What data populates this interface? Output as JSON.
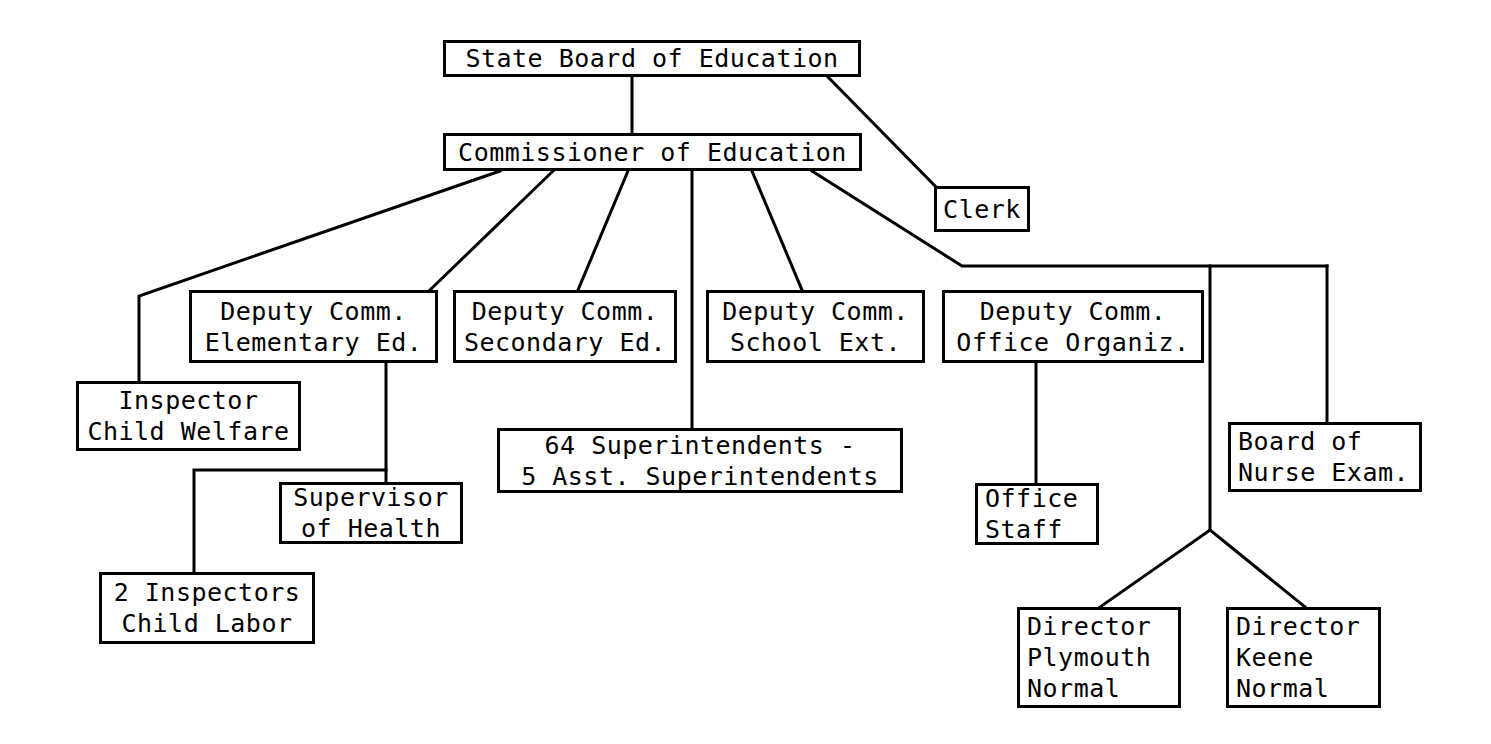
{
  "diagram": {
    "style": {
      "line_color": "#000000",
      "box_fill": "#ffffff",
      "background": "#ffffff"
    },
    "nodes": [
      {
        "id": "state-board",
        "name": "state-board-of-education",
        "lines": [
          "State Board of Education"
        ],
        "x": 443,
        "y": 40,
        "w": 418,
        "h": 37,
        "align": "center"
      },
      {
        "id": "commissioner",
        "name": "commissioner-of-education",
        "lines": [
          "Commissioner of Education"
        ],
        "x": 443,
        "y": 133,
        "w": 419,
        "h": 38,
        "align": "center"
      },
      {
        "id": "clerk",
        "name": "clerk",
        "lines": [
          "Clerk"
        ],
        "x": 934,
        "y": 186,
        "w": 96,
        "h": 46,
        "align": "center"
      },
      {
        "id": "deputy-elementary",
        "name": "deputy-comm-elementary-ed",
        "lines": [
          "Deputy Comm.",
          "Elementary Ed."
        ],
        "x": 189,
        "y": 290,
        "w": 249,
        "h": 73,
        "align": "center"
      },
      {
        "id": "deputy-secondary",
        "name": "deputy-comm-secondary-ed",
        "lines": [
          "Deputy Comm.",
          "Secondary Ed."
        ],
        "x": 453,
        "y": 290,
        "w": 224,
        "h": 73,
        "align": "center"
      },
      {
        "id": "deputy-school-ext",
        "name": "deputy-comm-school-ext",
        "lines": [
          "Deputy Comm.",
          "School Ext."
        ],
        "x": 706,
        "y": 290,
        "w": 219,
        "h": 73,
        "align": "center"
      },
      {
        "id": "deputy-office-organiz",
        "name": "deputy-comm-office-organiz",
        "lines": [
          "Deputy Comm.",
          "Office Organiz."
        ],
        "x": 942,
        "y": 290,
        "w": 262,
        "h": 73,
        "align": "center"
      },
      {
        "id": "inspector-child-welfare",
        "name": "inspector-child-welfare",
        "lines": [
          "Inspector",
          "Child Welfare"
        ],
        "x": 76,
        "y": 381,
        "w": 225,
        "h": 70,
        "align": "center"
      },
      {
        "id": "superintendents",
        "name": "superintendents-box",
        "lines": [
          "64 Superintendents -",
          "5 Asst. Superintendents"
        ],
        "x": 497,
        "y": 428,
        "w": 406,
        "h": 65,
        "align": "center"
      },
      {
        "id": "supervisor-health",
        "name": "supervisor-of-health",
        "lines": [
          "Supervisor",
          "of Health"
        ],
        "x": 279,
        "y": 482,
        "w": 184,
        "h": 62,
        "align": "center"
      },
      {
        "id": "inspectors-child-labor",
        "name": "inspectors-child-labor",
        "lines": [
          "2 Inspectors",
          "Child Labor"
        ],
        "x": 99,
        "y": 572,
        "w": 216,
        "h": 72,
        "align": "center"
      },
      {
        "id": "office-staff",
        "name": "office-staff",
        "lines": [
          "Office",
          "Staff"
        ],
        "x": 975,
        "y": 483,
        "w": 124,
        "h": 62,
        "align": "left"
      },
      {
        "id": "board-nurse-exam",
        "name": "board-of-nurse-exam",
        "lines": [
          "Board of",
          "Nurse Exam."
        ],
        "x": 1228,
        "y": 422,
        "w": 194,
        "h": 70,
        "align": "left"
      },
      {
        "id": "director-plymouth",
        "name": "director-plymouth-normal",
        "lines": [
          "Director",
          "Plymouth",
          "Normal"
        ],
        "x": 1017,
        "y": 607,
        "w": 164,
        "h": 101,
        "align": "left"
      },
      {
        "id": "director-keene",
        "name": "director-keene-normal",
        "lines": [
          "Director",
          "Keene",
          "Normal"
        ],
        "x": 1226,
        "y": 607,
        "w": 155,
        "h": 101,
        "align": "left"
      }
    ],
    "connectors": [
      {
        "name": "state-board-to-commissioner",
        "points": "632,77 632,133"
      },
      {
        "name": "state-board-to-clerk",
        "points": "828,77 937,188"
      },
      {
        "name": "commissioner-to-inspector-child-welfare",
        "points": "500,171 139,296 139,381"
      },
      {
        "name": "commissioner-to-deputy-elementary",
        "points": "553,171 430,290"
      },
      {
        "name": "commissioner-to-deputy-secondary",
        "points": "628,171 578,290"
      },
      {
        "name": "commissioner-to-superintendents",
        "points": "692,171 692,428"
      },
      {
        "name": "commissioner-to-deputy-school-ext",
        "points": "752,171 802,290"
      },
      {
        "name": "commissioner-to-deputy-office-organiz",
        "points": "812,171 962,266 1327,266"
      },
      {
        "name": "office-organiz-bus-vertical",
        "points": "1210,266 1210,530"
      },
      {
        "name": "bus-to-board-nurse-exam",
        "points": "1327,266 1327,422"
      },
      {
        "name": "deputy-elementary-to-supervisor-health",
        "points": "386,363 386,482"
      },
      {
        "name": "deputy-elementary-to-inspectors-child-labor",
        "points": "386,470 194,470 194,572"
      },
      {
        "name": "deputy-office-organiz-to-office-staff",
        "points": "1036,363 1036,483"
      },
      {
        "name": "junction-to-director-plymouth",
        "points": "1210,530 1100,607"
      },
      {
        "name": "junction-to-director-keene",
        "points": "1210,530 1305,607"
      }
    ]
  }
}
